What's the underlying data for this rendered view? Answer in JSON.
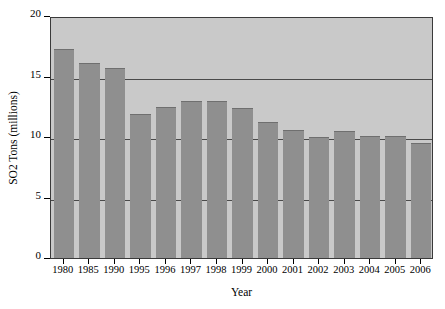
{
  "chart_data": {
    "type": "bar",
    "title": "",
    "xlabel": "Year",
    "ylabel": "SO2 Tons (millions)",
    "categories": [
      "1980",
      "1985",
      "1990",
      "1995",
      "1996",
      "1997",
      "1998",
      "1999",
      "2000",
      "2001",
      "2002",
      "2003",
      "2004",
      "2005",
      "2006"
    ],
    "values": [
      17.3,
      16.1,
      15.7,
      11.9,
      12.5,
      13.0,
      13.0,
      12.4,
      11.2,
      10.6,
      10.0,
      10.5,
      10.1,
      10.1,
      9.5
    ],
    "ylim": [
      0,
      20
    ],
    "yticks": [
      0,
      5,
      10,
      15,
      20
    ],
    "ytick_labels": [
      "0",
      "5",
      "10",
      "15",
      "20"
    ],
    "grid": true,
    "gridlines_at": [
      5,
      10,
      15
    ],
    "legend": "none",
    "bar_color": "#8f8f8f",
    "plot_background": "#c9c9c9",
    "axis_color": "#3a3a3a"
  }
}
